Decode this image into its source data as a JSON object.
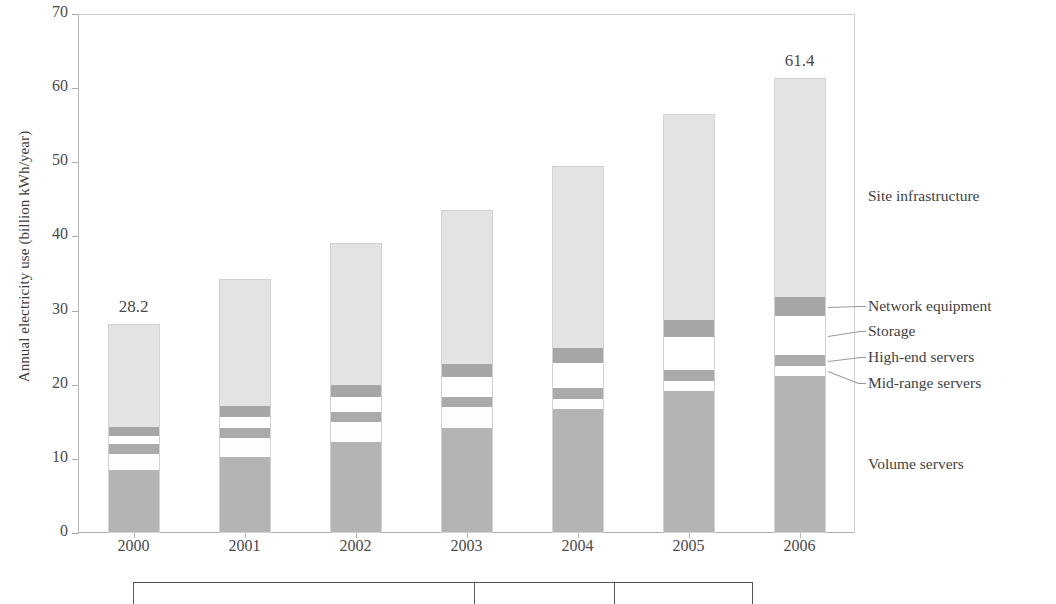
{
  "chart_data": {
    "type": "bar",
    "subtype": "stacked-bar",
    "title": "",
    "xlabel": "",
    "ylabel": "Annual electricity use (billion kWh/year)",
    "categories": [
      "2000",
      "2001",
      "2002",
      "2003",
      "2004",
      "2005",
      "2006"
    ],
    "ylim": [
      0,
      70
    ],
    "yticks": [
      0,
      10,
      20,
      30,
      40,
      50,
      60,
      70
    ],
    "grid": false,
    "legend_position": "right-direct-labels",
    "series": [
      {
        "name": "Volume servers",
        "color": "#b4b4b4",
        "values": [
          8.5,
          10.3,
          12.3,
          14.1,
          16.7,
          19.2,
          21.2
        ]
      },
      {
        "name": "Mid-range servers",
        "color": "#fdfdfd",
        "values": [
          2.2,
          2.5,
          2.7,
          2.9,
          1.4,
          1.3,
          1.3
        ]
      },
      {
        "name": "High-end servers",
        "color": "#aaaaaa",
        "values": [
          1.3,
          1.3,
          1.3,
          1.4,
          1.4,
          1.5,
          1.5
        ]
      },
      {
        "name": "Storage",
        "color": "#ffffff",
        "values": [
          1.1,
          1.6,
          2.1,
          2.6,
          3.4,
          4.4,
          5.2
        ]
      },
      {
        "name": "Network equipment",
        "color": "#a6a6a6",
        "values": [
          1.2,
          1.4,
          1.6,
          1.8,
          2.0,
          2.3,
          2.6
        ]
      },
      {
        "name": "Site infrastructure",
        "color": "#e3e3e3",
        "values": [
          13.9,
          17.2,
          19.1,
          20.8,
          24.6,
          27.8,
          29.6
        ]
      }
    ],
    "totals": [
      28.2,
      34.3,
      39.1,
      43.6,
      49.5,
      56.5,
      61.4
    ],
    "value_labels": [
      {
        "category": "2000",
        "text": "28.2",
        "shown": true
      },
      {
        "category": "2001",
        "text": "",
        "shown": false
      },
      {
        "category": "2002",
        "text": "",
        "shown": false
      },
      {
        "category": "2003",
        "text": "",
        "shown": false
      },
      {
        "category": "2004",
        "text": "",
        "shown": false
      },
      {
        "category": "2005",
        "text": "",
        "shown": false
      },
      {
        "category": "2006",
        "text": "61.4",
        "shown": true
      }
    ]
  },
  "axis": {
    "y_title": "Annual electricity use (billion kWh/year)",
    "y_tick_labels": [
      "70",
      "60",
      "50",
      "40",
      "30",
      "20",
      "10",
      "0"
    ],
    "x_tick_labels": [
      "2000",
      "2001",
      "2002",
      "2003",
      "2004",
      "2005",
      "2006"
    ]
  },
  "value_labels": {
    "first": "28.2",
    "last": "61.4"
  },
  "legend": {
    "items": [
      {
        "label": "Site infrastructure",
        "color": "#e3e3e3",
        "leader": false
      },
      {
        "label": "Network equipment",
        "color": "#a6a6a6",
        "leader": true
      },
      {
        "label": "Storage",
        "color": "#ffffff",
        "leader": true
      },
      {
        "label": "High-end servers",
        "color": "#aaaaaa",
        "leader": true
      },
      {
        "label": "Mid-range servers",
        "color": "#fdfdfd",
        "leader": true
      },
      {
        "label": "Volume servers",
        "color": "#b4b4b4",
        "leader": false
      }
    ]
  },
  "footer_table": {
    "visible_row": [
      "",
      "",
      ""
    ],
    "note": ""
  }
}
